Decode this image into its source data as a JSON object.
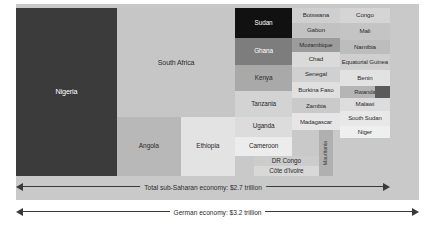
{
  "chart_data": {
    "type": "treemap",
    "title": "",
    "unit": "share of sub-Saharan GDP (tile area)",
    "totals": {
      "sub_saharan_label": "Total sub-Saharan economy: $2.7 trillion",
      "german_label": "German economy: $3.2 trillion",
      "sub_saharan_value": 2.7,
      "german_value": 3.2,
      "currency": "USD trillion"
    },
    "categories": [
      "Nigeria",
      "South Africa",
      "Angola",
      "Ethiopia",
      "Sudan",
      "Ghana",
      "Kenya",
      "Tanzania",
      "Uganda",
      "Cameroon",
      "DR Congo",
      "Côte d'Ivoire",
      "Botswana",
      "Gabon",
      "Mozambique",
      "Chad",
      "Senegal",
      "Burkina Faso",
      "Zambia",
      "Madagascar",
      "Mauritania",
      "Congo",
      "Mali",
      "Namibia",
      "Equatorial Guinea",
      "Benin",
      "Rwanda",
      "Malawi",
      "South Sudan",
      "Niger"
    ],
    "tiles": [
      {
        "label": "Nigeria",
        "color": "#3b3b3b",
        "text": "#ffffff",
        "x": 0.0,
        "y": 0.0,
        "w": 0.27,
        "h": 1.0,
        "fs": 7.2
      },
      {
        "label": "South Africa",
        "color": "#c6c6c6",
        "text": "#2b2b2b",
        "x": 0.27,
        "y": 0.0,
        "w": 0.316,
        "h": 0.65,
        "fs": 7.0
      },
      {
        "label": "Angola",
        "color": "#b8b8b8",
        "text": "#2b2b2b",
        "x": 0.27,
        "y": 0.65,
        "w": 0.17,
        "h": 0.35,
        "fs": 6.6
      },
      {
        "label": "Ethiopia",
        "color": "#e3e3e3",
        "text": "#2b2b2b",
        "x": 0.44,
        "y": 0.65,
        "w": 0.146,
        "h": 0.35,
        "fs": 6.6
      },
      {
        "label": "Sudan",
        "color": "#111111",
        "text": "#ffffff",
        "x": 0.586,
        "y": 0.0,
        "w": 0.152,
        "h": 0.176,
        "fs": 6.4
      },
      {
        "label": "Ghana",
        "color": "#7d7d7d",
        "text": "#ffffff",
        "x": 0.586,
        "y": 0.176,
        "w": 0.152,
        "h": 0.164,
        "fs": 6.4
      },
      {
        "label": "Kenya",
        "color": "#a9a9a9",
        "text": "#2b2b2b",
        "x": 0.586,
        "y": 0.34,
        "w": 0.152,
        "h": 0.157,
        "fs": 6.4
      },
      {
        "label": "Tanzania",
        "color": "#d3d3d3",
        "text": "#2b2b2b",
        "x": 0.586,
        "y": 0.497,
        "w": 0.152,
        "h": 0.15,
        "fs": 6.4
      },
      {
        "label": "Uganda",
        "color": "#dcdcdc",
        "text": "#2b2b2b",
        "x": 0.586,
        "y": 0.647,
        "w": 0.152,
        "h": 0.118,
        "fs": 6.4
      },
      {
        "label": "Cameroon",
        "color": "#ececec",
        "text": "#2b2b2b",
        "x": 0.586,
        "y": 0.765,
        "w": 0.152,
        "h": 0.115,
        "fs": 6.4
      },
      {
        "label": "DR Congo",
        "color": "#cccccc",
        "text": "#2b2b2b",
        "x": 0.636,
        "y": 0.88,
        "w": 0.174,
        "h": 0.06,
        "fs": 6.4
      },
      {
        "label": "Côte d'Ivoire",
        "color": "#d8d8d8",
        "text": "#2b2b2b",
        "x": 0.636,
        "y": 0.94,
        "w": 0.174,
        "h": 0.06,
        "fs": 6.4
      },
      {
        "label": "Botswana",
        "color": "#cfcfcf",
        "text": "#2b2b2b",
        "x": 0.738,
        "y": 0.0,
        "w": 0.128,
        "h": 0.088,
        "fs": 6.2
      },
      {
        "label": "Gabon",
        "color": "#c2c2c2",
        "text": "#2b2b2b",
        "x": 0.738,
        "y": 0.088,
        "w": 0.128,
        "h": 0.088,
        "fs": 6.2
      },
      {
        "label": "Mozambique",
        "color": "#9c9c9c",
        "text": "#2b2b2b",
        "x": 0.738,
        "y": 0.176,
        "w": 0.128,
        "h": 0.084,
        "fs": 6.0
      },
      {
        "label": "Chad",
        "color": "#dadada",
        "text": "#2b2b2b",
        "x": 0.738,
        "y": 0.26,
        "w": 0.128,
        "h": 0.09,
        "fs": 6.2
      },
      {
        "label": "Senegal",
        "color": "#d0d0d0",
        "text": "#2b2b2b",
        "x": 0.738,
        "y": 0.35,
        "w": 0.128,
        "h": 0.088,
        "fs": 6.2
      },
      {
        "label": "Burkina Faso",
        "color": "#e0e0e0",
        "text": "#2b2b2b",
        "x": 0.738,
        "y": 0.438,
        "w": 0.128,
        "h": 0.1,
        "fs": 6.2
      },
      {
        "label": "Zambia",
        "color": "#cacaca",
        "text": "#2b2b2b",
        "x": 0.738,
        "y": 0.538,
        "w": 0.128,
        "h": 0.088,
        "fs": 6.2
      },
      {
        "label": "Madagascar",
        "color": "#e6e6e6",
        "text": "#2b2b2b",
        "x": 0.738,
        "y": 0.626,
        "w": 0.128,
        "h": 0.1,
        "fs": 6.0
      },
      {
        "label": "Mauritania",
        "color": "#b0b0b0",
        "text": "#3a3a3a",
        "x": 0.81,
        "y": 0.726,
        "w": 0.038,
        "h": 0.274,
        "fs": 5.4,
        "rotated": true
      },
      {
        "label": "Congo",
        "color": "#d5d5d5",
        "text": "#2b2b2b",
        "x": 0.866,
        "y": 0.0,
        "w": 0.134,
        "h": 0.088,
        "fs": 6.2
      },
      {
        "label": "Mali",
        "color": "#c4c4c4",
        "text": "#2b2b2b",
        "x": 0.866,
        "y": 0.088,
        "w": 0.134,
        "h": 0.102,
        "fs": 6.2
      },
      {
        "label": "Namibia",
        "color": "#bdbdbd",
        "text": "#2b2b2b",
        "x": 0.866,
        "y": 0.19,
        "w": 0.134,
        "h": 0.084,
        "fs": 6.2
      },
      {
        "label": "Equatorial Guinea",
        "color": "#cfcfcf",
        "text": "#2b2b2b",
        "x": 0.866,
        "y": 0.274,
        "w": 0.134,
        "h": 0.098,
        "fs": 6.0
      },
      {
        "label": "Benin",
        "color": "#e2e2e2",
        "text": "#2b2b2b",
        "x": 0.866,
        "y": 0.372,
        "w": 0.134,
        "h": 0.09,
        "fs": 6.2
      },
      {
        "label": "Rwanda",
        "color": "#b5b5b5",
        "text": "#2b2b2b",
        "x": 0.866,
        "y": 0.462,
        "w": 0.134,
        "h": 0.076,
        "fs": 6.0
      },
      {
        "label": "Malawi",
        "color": "#dddddd",
        "text": "#2b2b2b",
        "x": 0.866,
        "y": 0.538,
        "w": 0.134,
        "h": 0.074,
        "fs": 6.2
      },
      {
        "label": "South Sudan",
        "color": "#e8e8e8",
        "text": "#2b2b2b",
        "x": 0.866,
        "y": 0.612,
        "w": 0.134,
        "h": 0.09,
        "fs": 6.0
      },
      {
        "label": "Niger",
        "color": "#efefef",
        "text": "#2b2b2b",
        "x": 0.866,
        "y": 0.702,
        "w": 0.134,
        "h": 0.074,
        "fs": 6.2
      }
    ],
    "rwanda_marker_color": "#5a5a5a",
    "background_color": "#c9c9c9",
    "page_color": "#ffffff"
  }
}
